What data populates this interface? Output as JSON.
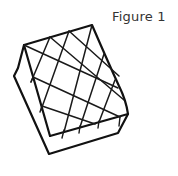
{
  "figure": {
    "label": "Figure 1",
    "stroke_color": "#111111",
    "background": "#ffffff"
  }
}
